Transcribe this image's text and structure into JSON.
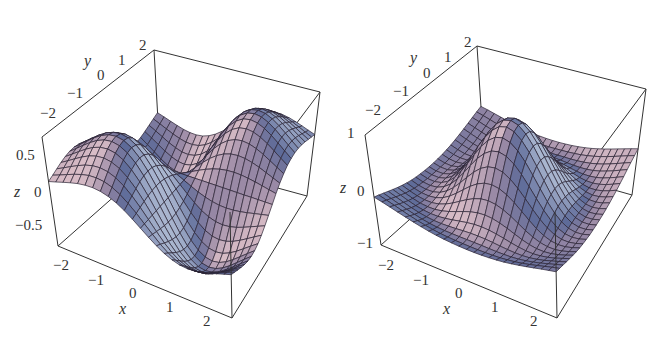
{
  "chart_data": [
    {
      "type": "surface3d",
      "title": "",
      "xlabel": "x",
      "ylabel": "y",
      "zlabel": "z",
      "x_range": [
        -2,
        2
      ],
      "y_range": [
        -2,
        2
      ],
      "z_range": [
        -0.8,
        0.8
      ],
      "x_ticks": [
        "−2",
        "−1",
        "0",
        "1",
        "2"
      ],
      "y_ticks": [
        "−2",
        "−1",
        "0",
        "1",
        "2"
      ],
      "z_ticks": [
        "0.5",
        "0",
        "−0.5"
      ],
      "grid_cells": 24,
      "surface": "two peaks and two troughs (saddle-like dipole pair), approx z = 2·x·y·exp(−(x²+y²)/2)",
      "amplitude": 2.0,
      "kind": "xy-gauss",
      "peak_z": 0.74,
      "min_z": -0.74
    },
    {
      "type": "surface3d",
      "title": "",
      "xlabel": "x",
      "ylabel": "y",
      "zlabel": "z",
      "x_range": [
        -2,
        2
      ],
      "y_range": [
        -2,
        2
      ],
      "z_range": [
        -1,
        1
      ],
      "x_ticks": [
        "−2",
        "−1",
        "0",
        "1",
        "2"
      ],
      "y_ticks": [
        "−2",
        "−1",
        "0",
        "1",
        "2"
      ],
      "z_ticks": [
        "1",
        "0",
        "−1"
      ],
      "grid_cells": 24,
      "surface": "single central peak with surrounding trough (Mexican hat), approx z = (1−(x²+y²))·exp(−(x²+y²)/2)",
      "amplitude": 1.0,
      "kind": "mexican-hat",
      "peak_z": 1.0,
      "min_z": -0.45
    }
  ],
  "colors": {
    "surface_lit": "#d8bcc6",
    "surface_mid": "#9b8aa6",
    "surface_shadow": "#5d6a98",
    "highlight": "#dce8f4",
    "mesh": "#2a2333",
    "box": "#333333"
  },
  "plots": [
    {
      "labels": {
        "y_axis_name": "y",
        "x_axis_name": "x",
        "z_axis_name": "z",
        "y_ticks": [
          "−2",
          "−1",
          "0",
          "1",
          "2"
        ],
        "x_ticks": [
          "−2",
          "−1",
          "0",
          "1",
          "2"
        ],
        "z_ticks": [
          "0.5",
          "0",
          "−0.5"
        ]
      }
    },
    {
      "labels": {
        "y_axis_name": "y",
        "x_axis_name": "x",
        "z_axis_name": "z",
        "y_ticks": [
          "−2",
          "−1",
          "0",
          "1",
          "2"
        ],
        "x_ticks": [
          "−2",
          "−1",
          "0",
          "1",
          "2"
        ],
        "z_ticks": [
          "1",
          "0",
          "−1"
        ]
      }
    }
  ]
}
